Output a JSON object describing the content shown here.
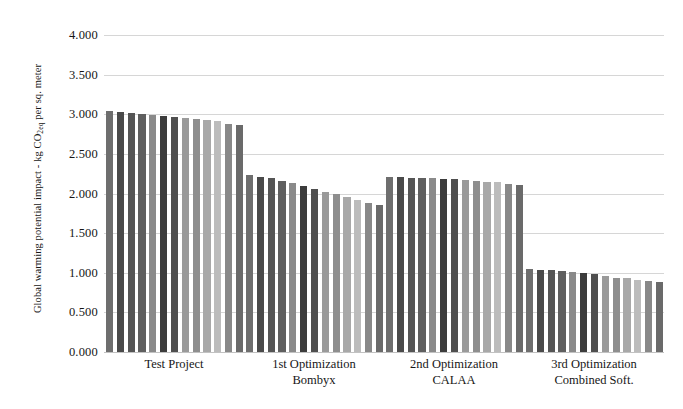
{
  "chart_data": {
    "type": "bar",
    "title": "",
    "subtitle": "",
    "xlabel": "",
    "ylabel": "Global warming potential impact - kg CO2eq per sq. meter",
    "ylabel_prefix": "Global warming potential impact - kg CO",
    "ylabel_sub": "2eq",
    "ylabel_suffix": " per sq. meter",
    "ylim": [
      0,
      4
    ],
    "ytick_values": [
      0,
      0.5,
      1,
      1.5,
      2,
      2.5,
      3,
      3.5,
      4
    ],
    "ytick_labels": [
      "0.000",
      "0.500",
      "1.000",
      "1.500",
      "2.000",
      "2.500",
      "3.000",
      "3.500",
      "4.000"
    ],
    "grid": true,
    "grid_axis": "y",
    "legend": false,
    "legend_position": "none",
    "categories": [
      "Test Project",
      "1st Optimization Bombyx",
      "2nd Optimization CALAA",
      "3rd Optimization Combined Soft."
    ],
    "category_labels": [
      {
        "line1": "Test Project",
        "line2": ""
      },
      {
        "line1": "1st Optimization",
        "line2": "Bombyx"
      },
      {
        "line1": "2nd Optimization",
        "line2": "CALAA"
      },
      {
        "line1": "3rd Optimization",
        "line2": "Combined Soft."
      }
    ],
    "bars_per_group": 13,
    "bar_colors": [
      "#6e6e6e",
      "#4a4a4a",
      "#555555",
      "#5f5f5f",
      "#8a8a8a",
      "#3c3c3c",
      "#4f4f4f",
      "#9a9a9a",
      "#8e8e8e",
      "#a8a8a8",
      "#bcbcbc",
      "#888888",
      "#6a6a6a"
    ],
    "groups": [
      {
        "name": "Test Project",
        "values": [
          3.04,
          3.03,
          3.02,
          3.0,
          2.99,
          2.98,
          2.97,
          2.95,
          2.94,
          2.93,
          2.91,
          2.88,
          2.86
        ]
      },
      {
        "name": "1st Optimization Bombyx",
        "values": [
          2.23,
          2.21,
          2.19,
          2.16,
          2.13,
          2.1,
          2.06,
          2.02,
          1.99,
          1.96,
          1.92,
          1.88,
          1.85
        ]
      },
      {
        "name": "2nd Optimization CALAA",
        "values": [
          2.21,
          2.21,
          2.2,
          2.2,
          2.19,
          2.18,
          2.18,
          2.17,
          2.16,
          2.15,
          2.14,
          2.12,
          2.11
        ]
      },
      {
        "name": "3rd Optimization Combined Soft.",
        "values": [
          1.05,
          1.04,
          1.03,
          1.02,
          1.01,
          1.0,
          0.99,
          0.96,
          0.94,
          0.93,
          0.91,
          0.89,
          0.88
        ]
      }
    ]
  }
}
